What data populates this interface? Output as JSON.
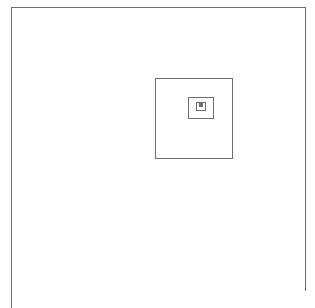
{
  "figure": {
    "type": "recursive-rectangle-fractal",
    "canvas": {
      "width": 315,
      "height": 308,
      "background_color": "#ffffff"
    },
    "stroke": {
      "color": "#6e6e6e",
      "width": 1,
      "style": "solid",
      "fill": "none"
    },
    "depth": 6,
    "rectangles": [
      {
        "index": 0,
        "label": "outer-rectangle",
        "x": 11,
        "y": 7,
        "width": 294,
        "height": 284,
        "clipped_bottom": true
      },
      {
        "index": 1,
        "label": "rectangle-level-2",
        "x": 155,
        "y": 78,
        "width": 77,
        "height": 80,
        "clipped_bottom": false
      },
      {
        "index": 2,
        "label": "rectangle-level-3",
        "x": 188,
        "y": 97,
        "width": 25,
        "height": 21,
        "clipped_bottom": false
      },
      {
        "index": 3,
        "label": "rectangle-level-4",
        "x": 196,
        "y": 102,
        "width": 9.5,
        "height": 8,
        "clipped_bottom": false
      },
      {
        "index": 4,
        "label": "rectangle-level-5",
        "x": 199.2,
        "y": 103.8,
        "width": 3.6,
        "height": 3.1,
        "clipped_bottom": false
      },
      {
        "index": 5,
        "label": "rectangle-level-6",
        "x": 200.4,
        "y": 104.5,
        "width": 1.4,
        "height": 1.2,
        "clipped_bottom": false
      }
    ]
  }
}
